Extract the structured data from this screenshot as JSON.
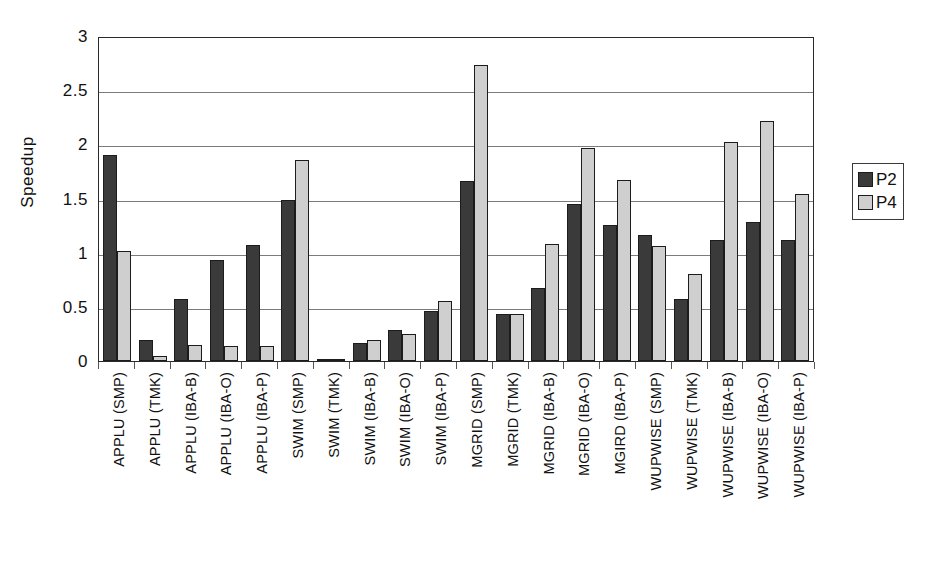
{
  "chart_data": {
    "type": "bar",
    "title": "",
    "xlabel": "",
    "ylabel": "Speedup",
    "ylim": [
      0,
      3
    ],
    "ytick_labels": [
      "3",
      "2.5",
      "2",
      "1.5",
      "1",
      "0.5",
      "0"
    ],
    "ytick_values": [
      3,
      2.5,
      2,
      1.5,
      1,
      0.5,
      0
    ],
    "grid": "horizontal",
    "legend_position": "right",
    "categories": [
      "APPLU (SMP)",
      "APPLU (TMK)",
      "APPLU (IBA-B)",
      "APPLU (IBA-O)",
      "APPLU (IBA-P)",
      "SWIM (SMP)",
      "SWIM (TMK)",
      "SWIM (IBA-B)",
      "SWIM (IBA-O)",
      "SWIM (IBA-P)",
      "MGRID (SMP)",
      "MGRID (TMK)",
      "MGRID (IBA-B)",
      "MGRID (IBA-O)",
      "MGIRD (IBA-P)",
      "WUPWISE (SMP)",
      "WUPWISE (TMK)",
      "WUPWISE (IBA-B)",
      "WUPWISE (IBA-O)",
      "WUPWISE (IBA-P)"
    ],
    "series": [
      {
        "name": "P2",
        "color": "#3a3a3a",
        "values": [
          1.9,
          0.19,
          0.57,
          0.93,
          1.07,
          1.49,
          0.02,
          0.17,
          0.29,
          0.46,
          1.66,
          0.43,
          0.67,
          1.45,
          1.26,
          1.16,
          0.57,
          1.12,
          1.28,
          1.12
        ]
      },
      {
        "name": "P4",
        "color": "#cfcfcf",
        "values": [
          1.02,
          0.05,
          0.15,
          0.14,
          0.14,
          1.86,
          0.02,
          0.19,
          0.25,
          0.55,
          2.73,
          0.43,
          1.08,
          1.97,
          1.67,
          1.06,
          0.8,
          2.02,
          2.22,
          1.54
        ]
      }
    ]
  },
  "legend": {
    "items": [
      {
        "label": "P2",
        "color": "#3a3a3a"
      },
      {
        "label": "P4",
        "color": "#cfcfcf"
      }
    ]
  }
}
